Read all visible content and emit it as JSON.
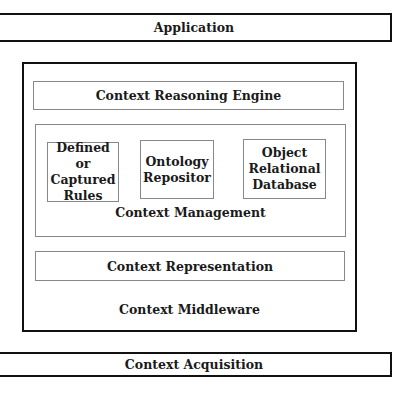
{
  "diagram": {
    "application": "Application",
    "middleware": {
      "label": "Context Middleware",
      "reasoning_engine": "Context Reasoning Engine",
      "management": {
        "label": "Context Management",
        "components": [
          {
            "line1": "Defined or",
            "line2": "Captured",
            "line3": "Rules"
          },
          {
            "line1": "Ontology",
            "line2": "Repositor",
            "line3": ""
          },
          {
            "line1": "Object",
            "line2": "Relational",
            "line3": "Database"
          }
        ]
      },
      "representation": "Context Representation"
    },
    "acquisition": "Context Acquisition"
  }
}
